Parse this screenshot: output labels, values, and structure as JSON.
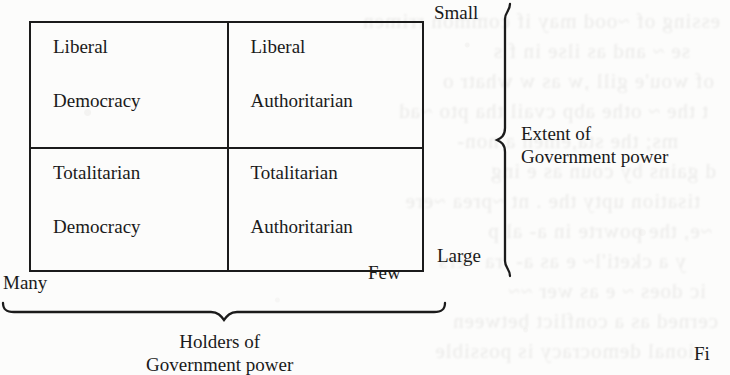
{
  "page": {
    "background_color": "#fcfcfb",
    "ink_color": "#1a1a1a",
    "width": 730,
    "height": 375
  },
  "diagram": {
    "type": "two-by-two-matrix",
    "matrix": {
      "cells": [
        {
          "position": "top-left",
          "line1": "Liberal",
          "line2": "Democracy"
        },
        {
          "position": "top-right",
          "line1": "Liberal",
          "line2": "Authoritarian"
        },
        {
          "position": "bottom-left",
          "line1": "Totalitarian",
          "line2": "Democracy"
        },
        {
          "position": "bottom-right",
          "line1": "Totalitarian",
          "line2": "Authoritarian"
        }
      ]
    },
    "axes": {
      "vertical": {
        "caption_line1": "Extent of",
        "caption_line2": "Government power",
        "top_label": "Small",
        "bottom_label": "Large"
      },
      "horizontal": {
        "caption_line1": "Holders of",
        "caption_line2": "Government power",
        "left_label": "Many",
        "right_label": "Few"
      }
    }
  },
  "figure_caption_fragment": "Fi",
  "show_through_text": [
    "essing of ~ood may if common rrimen",
    "se ~ and as ilse in f s",
    "of wou'e gill ,w as w whatr o",
    "t the ~ othe abp cvail tha pto ~ad",
    "ms; the sta,emen a non-",
    "d gains by coun as e ing",
    "tisation upty the . nt ~prea ~ere",
    "~e, the powrte in a- al p",
    "y a cketi'l~ e as a-  ra ~ers",
    "ic does ~ e as wer ~~",
    "cerned as a conflict between",
    "ional democracy is possible"
  ]
}
